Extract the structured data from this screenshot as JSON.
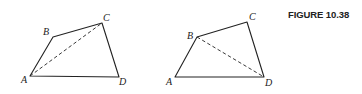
{
  "caption": "FIGURE 10.38",
  "colors": {
    "ink": "#222222",
    "background": "#ffffff"
  },
  "figures": [
    {
      "name": "quadrilateral-left",
      "vertices": {
        "A": {
          "label": "A",
          "x": 30,
          "y": 76
        },
        "B": {
          "label": "B",
          "x": 53,
          "y": 37
        },
        "C": {
          "label": "C",
          "x": 102,
          "y": 23
        },
        "D": {
          "label": "D",
          "x": 119,
          "y": 77
        }
      },
      "diagonal": {
        "from": "A",
        "to": "C",
        "style": "dashed"
      }
    },
    {
      "name": "quadrilateral-right",
      "vertices": {
        "A": {
          "label": "A",
          "x": 175,
          "y": 77
        },
        "B": {
          "label": "B",
          "x": 197,
          "y": 37
        },
        "C": {
          "label": "C",
          "x": 247,
          "y": 22
        },
        "D": {
          "label": "D",
          "x": 264,
          "y": 77
        }
      },
      "diagonal": {
        "from": "B",
        "to": "D",
        "style": "dashed"
      }
    }
  ]
}
